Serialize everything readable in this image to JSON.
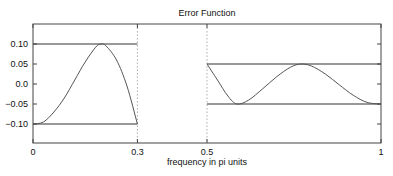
{
  "chart_data": {
    "type": "line",
    "title": "Error Function",
    "xlabel": "frequency in pi units",
    "ylabel": "",
    "xlim": [
      0,
      1
    ],
    "ylim": [
      -0.15,
      0.15
    ],
    "grid": false,
    "legend": null,
    "x_ticks": [
      0,
      0.3,
      0.5,
      1
    ],
    "x_tick_labels": [
      "0",
      "0.3",
      "0.5",
      "1"
    ],
    "y_ticks": [
      0.1,
      0.05,
      0.0,
      -0.05,
      -0.1
    ],
    "y_tick_labels": [
      "0.10",
      "0.05",
      "0.0",
      "−0.05",
      "−0.10"
    ],
    "vertical_dotted_lines": [
      0.3,
      0.5
    ],
    "tolerance_bands": [
      {
        "name": "passband",
        "x": [
          0,
          0.3
        ],
        "upper": 0.1,
        "lower": -0.1
      },
      {
        "name": "stopband",
        "x": [
          0.5,
          1
        ],
        "upper": 0.05,
        "lower": -0.05
      }
    ],
    "series": [
      {
        "name": "error-passband",
        "x": [
          0,
          0.03,
          0.06,
          0.09,
          0.12,
          0.15,
          0.18,
          0.195,
          0.21,
          0.24,
          0.27,
          0.3
        ],
        "y": [
          -0.1,
          -0.095,
          -0.07,
          -0.035,
          0.01,
          0.055,
          0.092,
          0.1,
          0.095,
          0.06,
          -0.005,
          -0.1
        ]
      },
      {
        "name": "error-stopband",
        "x": [
          0.5,
          0.53,
          0.56,
          0.586,
          0.62,
          0.66,
          0.7,
          0.74,
          0.77,
          0.8,
          0.84,
          0.88,
          0.92,
          0.96,
          1.0
        ],
        "y": [
          0.05,
          0.01,
          -0.03,
          -0.05,
          -0.04,
          -0.012,
          0.018,
          0.042,
          0.05,
          0.045,
          0.025,
          -0.002,
          -0.028,
          -0.046,
          -0.05
        ]
      }
    ]
  }
}
